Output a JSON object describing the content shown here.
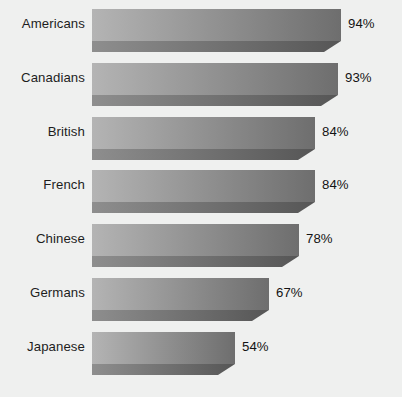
{
  "chart_data": {
    "type": "bar",
    "orientation": "horizontal",
    "title": "",
    "subtitle": "",
    "xlabel": "",
    "ylabel": "",
    "grid": false,
    "legend": null,
    "axis_visible": false,
    "xlim": [
      0,
      100
    ],
    "value_suffix": "%",
    "categories": [
      "Americans",
      "Canadians",
      "British",
      "French",
      "Chinese",
      "Germans",
      "Japanese"
    ],
    "values": [
      94,
      93,
      84,
      84,
      78,
      67,
      54
    ],
    "value_labels": [
      "94%",
      "93%",
      "84%",
      "84%",
      "78%",
      "67%",
      "54%"
    ],
    "bars": [
      {
        "category": "Americans",
        "value": 94,
        "value_label": "94%"
      },
      {
        "category": "Canadians",
        "value": 93,
        "value_label": "93%"
      },
      {
        "category": "British",
        "value": 84,
        "value_label": "84%"
      },
      {
        "category": "French",
        "value": 84,
        "value_label": "84%"
      },
      {
        "category": "Chinese",
        "value": 78,
        "value_label": "78%"
      },
      {
        "category": "Germans",
        "value": 67,
        "value_label": "67%"
      },
      {
        "category": "Japanese",
        "value": 54,
        "value_label": "54%"
      }
    ],
    "colors": {
      "background": "#eff0ef",
      "bar_gradient_start": "#b4b4b4",
      "bar_gradient_end": "#6e6e6e",
      "bar_shadow_start": "#8e8e8e",
      "bar_shadow_end": "#565656",
      "label_text": "#1d1d1d",
      "value_text": "#141414"
    }
  }
}
